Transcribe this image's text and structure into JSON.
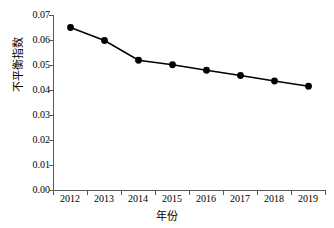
{
  "chart_data": {
    "type": "line",
    "title": "",
    "xlabel": "年份",
    "ylabel": "不平衡指数",
    "categories": [
      "2012",
      "2013",
      "2014",
      "2015",
      "2016",
      "2017",
      "2018",
      "2019"
    ],
    "values": [
      0.065,
      0.0598,
      0.0519,
      0.0501,
      0.0479,
      0.0458,
      0.0436,
      0.0415
    ],
    "series": [
      {
        "name": "不平衡指数",
        "values": [
          0.065,
          0.0598,
          0.0519,
          0.0501,
          0.0479,
          0.0458,
          0.0436,
          0.0415
        ]
      }
    ],
    "ylim": [
      0.0,
      0.07
    ],
    "ytick_labels": [
      "0.00",
      "0.01",
      "0.02",
      "0.03",
      "0.04",
      "0.05",
      "0.06",
      "0.07"
    ],
    "ytick_values": [
      0.0,
      0.01,
      0.02,
      0.03,
      0.04,
      0.05,
      0.06,
      0.07
    ],
    "grid": false,
    "legend": false,
    "legend_position": "none",
    "marker": "circle",
    "line_color": "#000000",
    "marker_color": "#000000",
    "background_color": "#ffffff"
  }
}
